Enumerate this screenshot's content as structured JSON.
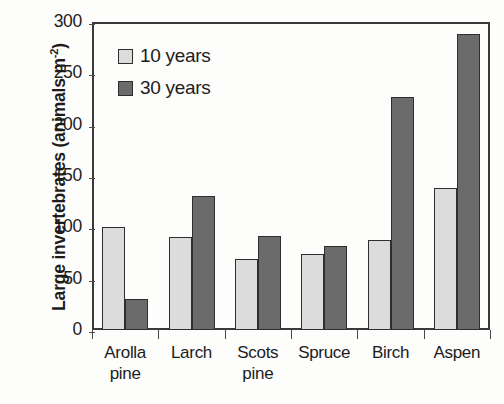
{
  "chart_data": {
    "type": "bar",
    "title": "",
    "xlabel": "",
    "ylabel": "Large invertebrates (animals m-2)",
    "ylabel_main": "Large invertebrates (animals m",
    "ylabel_sup": "-2",
    "ylabel_tail": ")",
    "categories": [
      "Arolla pine",
      "Larch",
      "Scots pine",
      "Spruce",
      "Birch",
      "Aspen"
    ],
    "categories_lines": [
      [
        "Arolla",
        "pine"
      ],
      [
        "Larch",
        ""
      ],
      [
        "Scots",
        "pine"
      ],
      [
        "Spruce",
        ""
      ],
      [
        "Birch",
        ""
      ],
      [
        "Aspen",
        ""
      ]
    ],
    "series": [
      {
        "name": "10 years",
        "color": "#dcdcdc",
        "values": [
          100,
          91,
          69,
          74,
          88,
          138
        ]
      },
      {
        "name": "30 years",
        "color": "#6b6b6b",
        "values": [
          30,
          131,
          92,
          82,
          227,
          288
        ]
      }
    ],
    "ylim": [
      0,
      300
    ],
    "yticks": [
      300,
      250,
      200,
      150,
      100,
      50,
      0
    ],
    "ytick_labels": [
      "300",
      "250",
      "200",
      "150",
      "100",
      "50",
      "0"
    ],
    "grid": false,
    "legend_position": "top-left",
    "legend": [
      "10 years",
      "30 years"
    ]
  }
}
